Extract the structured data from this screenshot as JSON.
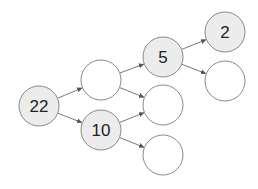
{
  "diagram": {
    "type": "tree",
    "colors": {
      "filled_node": "#ececec",
      "empty_node": "#ffffff",
      "stroke": "#8a8a8a",
      "edge": "#6a6a6a",
      "text": "#222222"
    },
    "nodes": [
      {
        "id": "n22",
        "label": "22",
        "cx": 39,
        "cy": 106,
        "r": 20,
        "filled": true
      },
      {
        "id": "nA",
        "label": "",
        "cx": 101,
        "cy": 80,
        "r": 20,
        "filled": false
      },
      {
        "id": "n10",
        "label": "10",
        "cx": 101,
        "cy": 130,
        "r": 20,
        "filled": true
      },
      {
        "id": "n5",
        "label": "5",
        "cx": 163,
        "cy": 57,
        "r": 20,
        "filled": true
      },
      {
        "id": "nB",
        "label": "",
        "cx": 163,
        "cy": 105,
        "r": 20,
        "filled": false
      },
      {
        "id": "nC",
        "label": "",
        "cx": 163,
        "cy": 155,
        "r": 20,
        "filled": false
      },
      {
        "id": "n2",
        "label": "2",
        "cx": 225,
        "cy": 32,
        "r": 20,
        "filled": true
      },
      {
        "id": "nD",
        "label": "",
        "cx": 225,
        "cy": 81,
        "r": 20,
        "filled": false
      }
    ],
    "edges": [
      {
        "from": "n22",
        "to": "nA"
      },
      {
        "from": "n22",
        "to": "n10"
      },
      {
        "from": "nA",
        "to": "n5"
      },
      {
        "from": "nA",
        "to": "nB"
      },
      {
        "from": "n10",
        "to": "nB"
      },
      {
        "from": "n10",
        "to": "nC"
      },
      {
        "from": "n5",
        "to": "n2"
      },
      {
        "from": "n5",
        "to": "nD"
      }
    ]
  }
}
